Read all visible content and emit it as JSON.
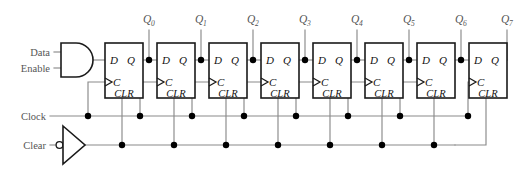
{
  "diagram": {
    "type": "logic-circuit-schematic"
  },
  "inputs": [
    {
      "id": "data",
      "label": "Data"
    },
    {
      "id": "enable",
      "label": "Enable"
    },
    {
      "id": "clock",
      "label": "Clock"
    },
    {
      "id": "clear",
      "label": "Clear"
    }
  ],
  "gates": [
    {
      "id": "and-gate",
      "kind": "AND",
      "inputs": [
        "Data",
        "Enable"
      ],
      "output_to": "flipflop-0.D"
    },
    {
      "id": "clear-inverter",
      "kind": "INVERTING-BUFFER",
      "inputs": [
        "Clear"
      ],
      "output_to": "clear-bus"
    }
  ],
  "flipflops": [
    {
      "index": 0,
      "kind": "D",
      "pin_d": "D",
      "pin_q": "Q",
      "pin_c": "C",
      "pin_clr": "CLR",
      "output_label": "Q",
      "output_sub": "0"
    },
    {
      "index": 1,
      "kind": "D",
      "pin_d": "D",
      "pin_q": "Q",
      "pin_c": "C",
      "pin_clr": "CLR",
      "output_label": "Q",
      "output_sub": "1"
    },
    {
      "index": 2,
      "kind": "D",
      "pin_d": "D",
      "pin_q": "Q",
      "pin_c": "C",
      "pin_clr": "CLR",
      "output_label": "Q",
      "output_sub": "2"
    },
    {
      "index": 3,
      "kind": "D",
      "pin_d": "D",
      "pin_q": "Q",
      "pin_c": "C",
      "pin_clr": "CLR",
      "output_label": "Q",
      "output_sub": "3"
    },
    {
      "index": 4,
      "kind": "D",
      "pin_d": "D",
      "pin_q": "Q",
      "pin_c": "C",
      "pin_clr": "CLR",
      "output_label": "Q",
      "output_sub": "4"
    },
    {
      "index": 5,
      "kind": "D",
      "pin_d": "D",
      "pin_q": "Q",
      "pin_c": "C",
      "pin_clr": "CLR",
      "output_label": "Q",
      "output_sub": "5"
    },
    {
      "index": 6,
      "kind": "D",
      "pin_d": "D",
      "pin_q": "Q",
      "pin_c": "C",
      "pin_clr": "CLR",
      "output_label": "Q",
      "output_sub": "6"
    },
    {
      "index": 7,
      "kind": "D",
      "pin_d": "D",
      "pin_q": "Q",
      "pin_c": "C",
      "pin_clr": "CLR",
      "output_label": "Q",
      "output_sub": "7"
    }
  ],
  "buses": [
    {
      "id": "clock-bus",
      "label": "Clock",
      "junction_count": 8
    },
    {
      "id": "clear-bus",
      "label": "Clear",
      "junction_count": 7
    }
  ],
  "colors": {
    "background": "#ffffff",
    "wire": "#8a8a8a",
    "outline": "#1a1a1a",
    "junction": "#000000",
    "label": "#555555",
    "pin_text": "#111111"
  }
}
